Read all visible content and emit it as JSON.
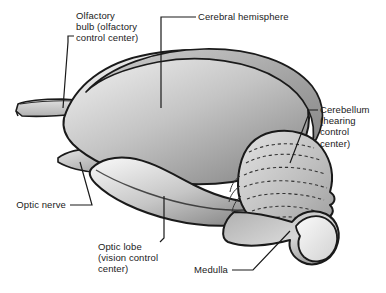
{
  "figure": {
    "type": "labeled-anatomical-diagram",
    "width": 386,
    "height": 293,
    "background_color": "#ffffff",
    "line_color": "#1a1a1a",
    "text_color": "#1a1a1a"
  },
  "labels": {
    "olfactory_bulb": "Olfactory\nbulb (olfactory\ncontrol center)",
    "cerebral_hemisphere": "Cerebral hemisphere",
    "cerebellum": "Cerebellum\n(hearing\ncontrol\ncenter)",
    "optic_nerve": "Optic nerve",
    "optic_lobe": "Optic lobe\n(vision control\ncenter)",
    "medulla": "Medulla"
  },
  "structures": {
    "cerebral_hemisphere": {
      "name": "Cerebral hemisphere",
      "fill_light": "#e8e8e8",
      "fill_mid": "#b9b9b9",
      "fill_dark": "#8e8e8e",
      "band_color": "#a0a0a0"
    },
    "olfactory_bulb": {
      "name": "Olfactory bulb",
      "fill": "#c9c9c9"
    },
    "optic_lobe": {
      "name": "Optic lobe",
      "fill_light": "#efefef",
      "fill_dark": "#8a8a8a"
    },
    "cerebellum": {
      "name": "Cerebellum",
      "fill_light": "#d8d8d8",
      "fill_dark": "#a8a8a8",
      "folia_style": "dashed"
    },
    "medulla": {
      "name": "Medulla",
      "fill_light": "#ededed",
      "fill_dark": "#9a9a9a"
    },
    "optic_nerve": {
      "name": "Optic nerve",
      "fill": "#cfcfcf"
    }
  }
}
